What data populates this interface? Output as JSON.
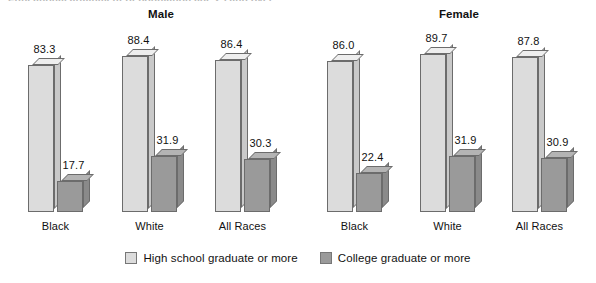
{
  "clipped_title": "Educational attainment of population age 25 and over",
  "panels": [
    {
      "id": "male",
      "title": "Male"
    },
    {
      "id": "female",
      "title": "Female"
    }
  ],
  "legend": {
    "items": [
      {
        "label": "High school graduate or more",
        "color": "#dcdcdc",
        "swatch": "hs-sw"
      },
      {
        "label": "College graduate or more",
        "color": "#9a9a9a",
        "swatch": "col-sw"
      }
    ]
  },
  "group_labels": [
    "Black",
    "White",
    "All Races",
    "Black",
    "White",
    "All Races"
  ],
  "bar_values": [
    "83.3",
    "17.7",
    "88.4",
    "31.9",
    "86.4",
    "30.3",
    "86.0",
    "22.4",
    "89.7",
    "31.9",
    "87.8",
    "30.9"
  ],
  "chart_data": {
    "type": "bar",
    "title": "Educational attainment of population age 25 and over",
    "xlabel": "",
    "ylabel": "Percent",
    "ylim": [
      0,
      100
    ],
    "grid": false,
    "legend_position": "bottom-center",
    "panels": [
      {
        "name": "Male",
        "categories": [
          "Black",
          "White",
          "All Races"
        ],
        "series": [
          {
            "name": "High school graduate or more",
            "values": [
              83.3,
              88.4,
              86.4
            ],
            "color": "#dcdcdc"
          },
          {
            "name": "College graduate or more",
            "values": [
              17.7,
              31.9,
              30.3
            ],
            "color": "#9a9a9a"
          }
        ]
      },
      {
        "name": "Female",
        "categories": [
          "Black",
          "White",
          "All Races"
        ],
        "series": [
          {
            "name": "High school graduate or more",
            "values": [
              86.0,
              89.7,
              87.8
            ],
            "color": "#dcdcdc"
          },
          {
            "name": "College graduate or more",
            "values": [
              22.4,
              31.9,
              30.9
            ],
            "color": "#9a9a9a"
          }
        ]
      }
    ]
  }
}
